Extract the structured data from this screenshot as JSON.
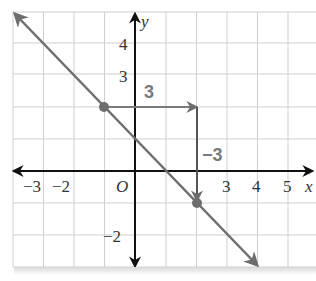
{
  "diagram": {
    "type": "coordinate-plane-line-slope",
    "axes": {
      "x_label": "x",
      "y_label": "y",
      "origin_label": "O",
      "x_tick_labels": [
        {
          "value": -3,
          "text": "−3"
        },
        {
          "value": -2,
          "text": "−2"
        },
        {
          "value": 3,
          "text": "3"
        },
        {
          "value": 4,
          "text": "4"
        },
        {
          "value": 5,
          "text": "5"
        }
      ],
      "y_tick_labels": [
        {
          "value": 4,
          "text": "4"
        },
        {
          "value": 3,
          "text": "3"
        },
        {
          "value": -2,
          "text": "−2"
        }
      ],
      "x_range": [
        -4,
        6
      ],
      "y_range": [
        -3,
        5
      ]
    },
    "line": {
      "slope": -1,
      "y_intercept": 1,
      "points": [
        {
          "x": -1,
          "y": 2
        },
        {
          "x": 2,
          "y": -1
        }
      ]
    },
    "rise_run": {
      "run_label": "3",
      "rise_label": "−3"
    },
    "colors": {
      "grid": "#c8c8c8",
      "axes": "#111111",
      "line": "#6d6d6d",
      "annotation": "#7a7a7a",
      "text": "#333333"
    }
  }
}
